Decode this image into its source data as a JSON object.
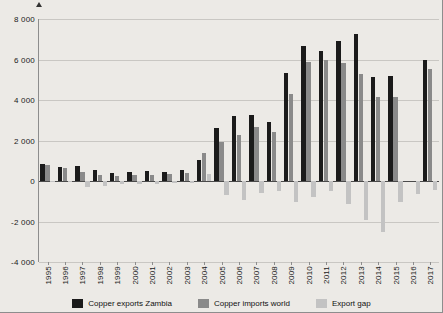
{
  "chart_data": {
    "type": "bar",
    "title": "",
    "subtitle": "",
    "xlabel": "",
    "ylabel": "",
    "ylim": [
      -4000,
      8000
    ],
    "ytick_values": [
      8000,
      6000,
      4000,
      2000,
      0,
      -2000,
      -4000
    ],
    "ytick_labels": [
      "8 000",
      "6 000",
      "4 000",
      "2 000",
      "0",
      "-2 000",
      "-4 000"
    ],
    "grid": true,
    "legend_position": "bottom",
    "categories": [
      "1995",
      "1996",
      "1997",
      "1998",
      "1999",
      "2000",
      "2001",
      "2002",
      "2003",
      "2004",
      "2005",
      "2006",
      "2007",
      "2008",
      "2009",
      "2010",
      "2011",
      "2012",
      "2013",
      "2014",
      "2015",
      "2016",
      "2017"
    ],
    "series": [
      {
        "name": "Copper exports Zambia",
        "color": "#1b1b1b",
        "values": [
          830,
          700,
          720,
          560,
          400,
          430,
          470,
          450,
          520,
          1030,
          2620,
          3220,
          3250,
          2900,
          5350,
          6680,
          6430,
          6930,
          7250,
          5150,
          5200,
          null,
          5980
        ]
      },
      {
        "name": "Copper imports world",
        "color": "#8a8a8a",
        "values": [
          790,
          640,
          420,
          300,
          270,
          300,
          300,
          330,
          400,
          1370,
          1930,
          2270,
          2650,
          2420,
          4300,
          5900,
          5960,
          5810,
          5300,
          4150,
          4150,
          null,
          5520
        ]
      },
      {
        "name": "Export gap",
        "color": "#c3c3c3",
        "values": [
          -40,
          -60,
          -300,
          -260,
          -130,
          -130,
          -170,
          -120,
          -120,
          340,
          -690,
          -950,
          -600,
          -480,
          -1050,
          -780,
          -470,
          -1120,
          -1950,
          -2500,
          -1050,
          -620,
          -460
        ]
      }
    ]
  },
  "legend": {
    "items": [
      {
        "label": "Copper exports Zambia",
        "color": "#1b1b1b"
      },
      {
        "label": "Copper imports world",
        "color": "#8a8a8a"
      },
      {
        "label": "Export gap",
        "color": "#c3c3c3"
      }
    ]
  }
}
